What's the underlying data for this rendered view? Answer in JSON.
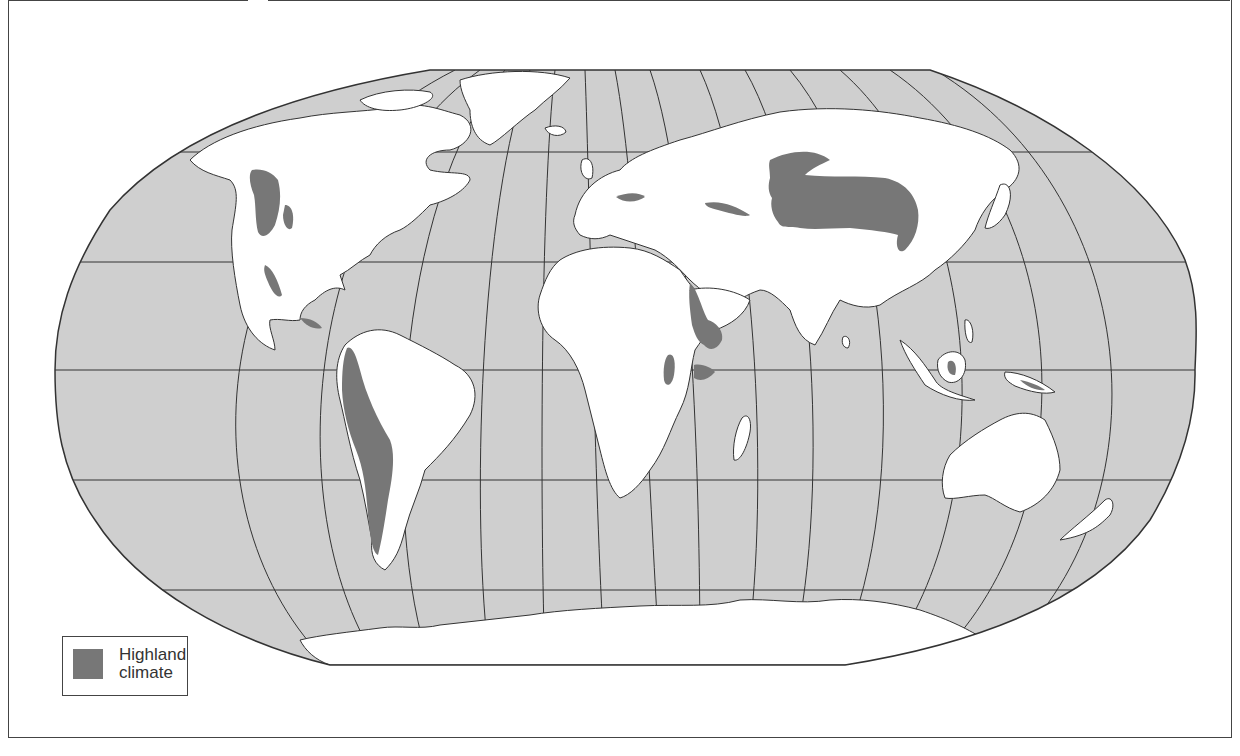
{
  "map": {
    "projection": "Robinson (world)",
    "colors": {
      "ocean": "#cfcfcf",
      "land": "#ffffff",
      "highland": "#777777",
      "graticule": "#333333",
      "outline": "#333333"
    },
    "highland_regions": [
      "Rocky Mountains / Western North America",
      "Sierra Madre (Mexico)",
      "Central America",
      "Andes (South America)",
      "Alps (Europe)",
      "Caucasus / Anatolia",
      "Tibetan Plateau / Himalaya / Central Asia",
      "Ethiopian Highlands",
      "East African Highlands",
      "Borneo interior",
      "New Guinea highlands"
    ]
  },
  "legend": {
    "items": [
      {
        "label_line1": "Highland",
        "label_line2": "climate",
        "color": "#777777"
      }
    ]
  }
}
